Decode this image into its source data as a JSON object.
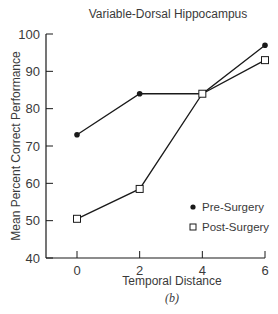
{
  "chart_data": {
    "type": "line",
    "title": "Variable-Dorsal Hippocampus",
    "xlabel": "Temporal Distance",
    "sublabel": "(b)",
    "ylabel": "Mean Percent Correct Performance",
    "x": [
      0,
      2,
      4,
      6
    ],
    "xticks": [
      "0",
      "2",
      "4",
      "6"
    ],
    "yticks": [
      "40",
      "50",
      "60",
      "70",
      "80",
      "90",
      "100"
    ],
    "ylim": [
      40,
      100
    ],
    "xlim": [
      -0.5,
      6
    ],
    "grid": false,
    "legend_position": "lower right",
    "series": [
      {
        "name": "Pre-Surgery",
        "marker": "filled-circle",
        "values": [
          73,
          84,
          84,
          97
        ]
      },
      {
        "name": "Post-Surgery",
        "marker": "open-square",
        "values": [
          50.5,
          58.5,
          84,
          93
        ]
      }
    ]
  },
  "colors": {
    "ink": "#1a1a1a",
    "text": "#3a3a3a"
  }
}
